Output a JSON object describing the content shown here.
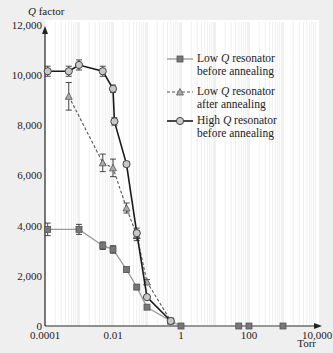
{
  "chart_data": {
    "type": "line",
    "title": "",
    "xlabel": "Torr",
    "ylabel": "Q factor",
    "xscale": "log",
    "xlim": [
      0.0001,
      10000
    ],
    "ylim": [
      0,
      12000
    ],
    "xticks": [
      0.0001,
      0.01,
      1,
      100,
      10000
    ],
    "xtick_labels": [
      "0.0001",
      "0.01",
      "1",
      "100",
      "10,000"
    ],
    "yticks": [
      0,
      2000,
      4000,
      6000,
      8000,
      10000,
      12000
    ],
    "ytick_labels": [
      "0",
      "2,000",
      "4,000",
      "6,000",
      "8,000",
      "10,000",
      "12,000"
    ],
    "grid": "vertical log gridlines",
    "legend_position": "upper right (inside plot)",
    "series": [
      {
        "name": "Low Q resonator before annealing",
        "legend_lines": [
          "Low Q resonator",
          "before annealing"
        ],
        "style": "solid-gray",
        "marker": "square",
        "color": "#8a8a8a",
        "x": [
          0.00012,
          0.001,
          0.005,
          0.01,
          0.025,
          0.05,
          0.1,
          0.5,
          1,
          50,
          100,
          1000
        ],
        "y": [
          3850,
          3850,
          3200,
          3050,
          2250,
          1550,
          750,
          200,
          0,
          0,
          0,
          0
        ],
        "error": [
          250,
          200,
          150,
          150,
          100,
          100,
          80,
          50,
          0,
          0,
          0,
          0
        ]
      },
      {
        "name": "Low Q resonator after annealing",
        "legend_lines": [
          "Low Q resonator",
          "after annealing"
        ],
        "style": "dashed",
        "marker": "triangle",
        "color": "#555555",
        "x": [
          0.0005,
          0.005,
          0.01,
          0.025,
          0.05,
          0.1,
          0.5
        ],
        "y": [
          9150,
          6500,
          6300,
          4700,
          3600,
          1750,
          200
        ],
        "error": [
          550,
          350,
          350,
          200,
          200,
          100,
          50
        ]
      },
      {
        "name": "High Q resonator before annealing",
        "legend_lines": [
          "High Q resonator",
          "before annealing"
        ],
        "style": "solid-black",
        "marker": "circle",
        "color": "#1a1a1a",
        "x": [
          0.00012,
          0.0005,
          0.001,
          0.005,
          0.01,
          0.011,
          0.025,
          0.05,
          0.1,
          0.5
        ],
        "y": [
          10150,
          10150,
          10400,
          10150,
          9450,
          8150,
          6450,
          3700,
          1150,
          200
        ],
        "error": [
          200,
          200,
          200,
          200,
          150,
          150,
          100,
          200,
          80,
          50
        ]
      }
    ]
  }
}
